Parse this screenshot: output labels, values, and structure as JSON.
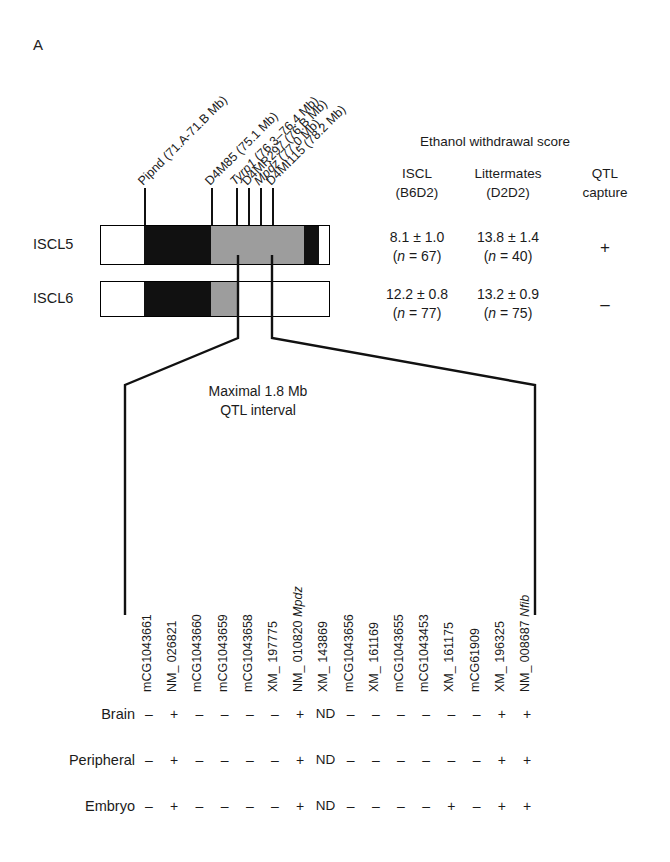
{
  "figure": {
    "panel_letter": "A",
    "markers": [
      {
        "label": "Pipnd (71.A-71.B Mb)",
        "x": 145
      },
      {
        "label": "D4M85 (75.1 Mb)",
        "x": 212
      },
      {
        "label": "Tyrp1 (76.3–76.4 Mb)",
        "x": 237,
        "italic_prefix": "Tyrp1"
      },
      {
        "label": "D4MR297 (76.B Mb)",
        "x": 249
      },
      {
        "label": "Mpdz (77.0 Mb)",
        "x": 261,
        "italic_prefix": "Mpdz"
      },
      {
        "label": "D4MI115 (78.2 Mb)",
        "x": 273
      }
    ],
    "strains": [
      {
        "name": "ISCL5",
        "iscl_score": "8.1 ± 1.0",
        "iscl_n": "(n = 67)",
        "litter_score": "13.8 ± 1.4",
        "litter_n": "(n = 40)",
        "qtl_capture": "+"
      },
      {
        "name": "ISCL6",
        "iscl_score": "12.2 ± 0.8",
        "iscl_n": "(n = 77)",
        "litter_score": "13.2 ± 0.9",
        "litter_n": "(n = 75)",
        "qtl_capture": "–"
      }
    ],
    "table": {
      "title": "Ethanol withdrawal score",
      "col_iscl_l1": "ISCL",
      "col_iscl_l2": "(B6D2)",
      "col_litter_l1": "Littermates",
      "col_litter_l2": "(D2D2)",
      "col_qtl_l1": "QTL",
      "col_qtl_l2": "capture"
    },
    "interval": {
      "line1": "Maximal 1.8 Mb",
      "line2": "QTL interval"
    },
    "genes": [
      {
        "id": "mCG1043661",
        "symbol": ""
      },
      {
        "id": "NM_ 026821",
        "symbol": ""
      },
      {
        "id": "mCG1043660",
        "symbol": ""
      },
      {
        "id": "mCG1043659",
        "symbol": ""
      },
      {
        "id": "mCG1043658",
        "symbol": ""
      },
      {
        "id": "XM_ 197775",
        "symbol": ""
      },
      {
        "id": "NM_ 010820",
        "symbol": "Mpdz"
      },
      {
        "id": "XM_ 143869",
        "symbol": ""
      },
      {
        "id": "mCG1043656",
        "symbol": ""
      },
      {
        "id": "XM_ 161169",
        "symbol": ""
      },
      {
        "id": "mCG1043655",
        "symbol": ""
      },
      {
        "id": "mCG1043453",
        "symbol": ""
      },
      {
        "id": "XM_ 161175",
        "symbol": ""
      },
      {
        "id": "mCG61909",
        "symbol": ""
      },
      {
        "id": "XM_ 196325",
        "symbol": ""
      },
      {
        "id": "NM_ 008687",
        "symbol": "Nfib"
      }
    ],
    "expression_rows": [
      {
        "tissue": "Brain",
        "values": [
          "–",
          "+",
          "–",
          "–",
          "–",
          "–",
          "+",
          "ND",
          "–",
          "–",
          "–",
          "–",
          "–",
          "–",
          "+",
          "+"
        ]
      },
      {
        "tissue": "Peripheral",
        "values": [
          "–",
          "+",
          "–",
          "–",
          "–",
          "–",
          "+",
          "ND",
          "–",
          "–",
          "–",
          "–",
          "–",
          "–",
          "+",
          "+"
        ]
      },
      {
        "tissue": "Embryo",
        "values": [
          "–",
          "+",
          "–",
          "–",
          "–",
          "–",
          "+",
          "ND",
          "–",
          "–",
          "–",
          "–",
          "+",
          "–",
          "+",
          "+"
        ]
      }
    ],
    "colors": {
      "b6_black": "#111111",
      "d2_gray": "#9d9d9d",
      "white": "#ffffff",
      "line": "#000000"
    }
  }
}
